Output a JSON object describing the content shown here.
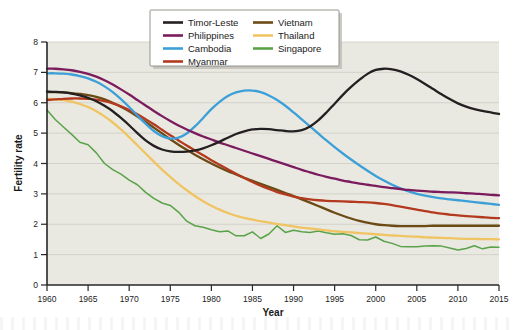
{
  "figure": {
    "caption_strip": "",
    "plot_background_color": "#e9e9e1",
    "page_background_color": "#ffffff"
  },
  "axes": {
    "x_label": "Year",
    "y_label": "Fertility rate",
    "x_ticks": [
      "1960",
      "1965",
      "1970",
      "1975",
      "1980",
      "1985",
      "1990",
      "1995",
      "2000",
      "2005",
      "2010",
      "2015"
    ],
    "y_ticks": [
      "0",
      "1",
      "2",
      "3",
      "4",
      "5",
      "6",
      "7",
      "8"
    ]
  },
  "legend": {
    "entries": [
      {
        "label": "Timor-Leste",
        "color": "#241f20"
      },
      {
        "label": "Vietnam",
        "color": "#6b4a16"
      },
      {
        "label": "Philippines",
        "color": "#7b1b5e"
      },
      {
        "label": "Thailand",
        "color": "#f0c462"
      },
      {
        "label": "Cambodia",
        "color": "#3d9fd8"
      },
      {
        "label": "Singapore",
        "color": "#5aa24a"
      },
      {
        "label": "Myanmar",
        "color": "#b33a1e"
      }
    ]
  },
  "chart_data": {
    "type": "line",
    "title": "",
    "subtitle": "",
    "xlabel": "Year",
    "ylabel": "Fertility rate",
    "xlim": [
      1960,
      2015
    ],
    "ylim": [
      0,
      8
    ],
    "grid": true,
    "legend_position": "top-center",
    "x": [
      1960,
      1961,
      1962,
      1963,
      1964,
      1965,
      1966,
      1967,
      1968,
      1969,
      1970,
      1971,
      1972,
      1973,
      1974,
      1975,
      1976,
      1977,
      1978,
      1979,
      1980,
      1981,
      1982,
      1983,
      1984,
      1985,
      1986,
      1987,
      1988,
      1989,
      1990,
      1991,
      1992,
      1993,
      1994,
      1995,
      1996,
      1997,
      1998,
      1999,
      2000,
      2001,
      2002,
      2003,
      2004,
      2005,
      2006,
      2007,
      2008,
      2009,
      2010,
      2011,
      2012,
      2013,
      2014,
      2015
    ],
    "series": [
      {
        "name": "Timor-Leste",
        "color": "#241f20",
        "values": [
          6.37,
          6.36,
          6.34,
          6.3,
          6.24,
          6.16,
          6.05,
          5.9,
          5.72,
          5.5,
          5.26,
          5.0,
          4.76,
          4.58,
          4.46,
          4.4,
          4.38,
          4.39,
          4.43,
          4.5,
          4.6,
          4.72,
          4.85,
          4.97,
          5.06,
          5.12,
          5.14,
          5.13,
          5.1,
          5.07,
          5.06,
          5.1,
          5.22,
          5.42,
          5.68,
          5.97,
          6.26,
          6.52,
          6.75,
          6.95,
          7.08,
          7.12,
          7.1,
          7.03,
          6.92,
          6.78,
          6.62,
          6.45,
          6.28,
          6.12,
          5.98,
          5.87,
          5.79,
          5.73,
          5.68,
          5.63
        ]
      },
      {
        "name": "Philippines",
        "color": "#7b1b5e",
        "values": [
          7.12,
          7.12,
          7.1,
          7.07,
          7.02,
          6.95,
          6.86,
          6.74,
          6.6,
          6.44,
          6.27,
          6.09,
          5.91,
          5.73,
          5.56,
          5.4,
          5.25,
          5.12,
          5.0,
          4.89,
          4.79,
          4.69,
          4.6,
          4.51,
          4.42,
          4.33,
          4.24,
          4.15,
          4.06,
          3.97,
          3.88,
          3.79,
          3.71,
          3.63,
          3.56,
          3.5,
          3.44,
          3.39,
          3.34,
          3.3,
          3.26,
          3.22,
          3.19,
          3.16,
          3.13,
          3.11,
          3.09,
          3.07,
          3.06,
          3.05,
          3.04,
          3.02,
          3.01,
          2.99,
          2.97,
          2.95
        ]
      },
      {
        "name": "Cambodia",
        "color": "#3d9fd8",
        "values": [
          6.97,
          6.97,
          6.96,
          6.93,
          6.88,
          6.8,
          6.69,
          6.54,
          6.35,
          6.12,
          5.86,
          5.58,
          5.31,
          5.07,
          4.9,
          4.82,
          4.85,
          4.99,
          5.22,
          5.5,
          5.79,
          6.03,
          6.22,
          6.34,
          6.4,
          6.4,
          6.35,
          6.24,
          6.09,
          5.9,
          5.68,
          5.45,
          5.22,
          4.99,
          4.76,
          4.54,
          4.33,
          4.13,
          3.94,
          3.76,
          3.59,
          3.44,
          3.3,
          3.18,
          3.08,
          3.0,
          2.94,
          2.89,
          2.85,
          2.82,
          2.79,
          2.76,
          2.73,
          2.7,
          2.67,
          2.64
        ]
      },
      {
        "name": "Myanmar",
        "color": "#b33a1e",
        "values": [
          6.09,
          6.11,
          6.13,
          6.14,
          6.14,
          6.13,
          6.1,
          6.05,
          5.98,
          5.88,
          5.76,
          5.62,
          5.46,
          5.29,
          5.11,
          4.93,
          4.76,
          4.59,
          4.43,
          4.27,
          4.11,
          3.96,
          3.81,
          3.66,
          3.52,
          3.39,
          3.27,
          3.16,
          3.06,
          2.98,
          2.91,
          2.86,
          2.82,
          2.79,
          2.77,
          2.76,
          2.75,
          2.74,
          2.73,
          2.72,
          2.7,
          2.67,
          2.63,
          2.58,
          2.53,
          2.48,
          2.43,
          2.39,
          2.35,
          2.32,
          2.29,
          2.27,
          2.25,
          2.23,
          2.21,
          2.2
        ]
      },
      {
        "name": "Vietnam",
        "color": "#6b4a16",
        "values": [
          6.35,
          6.35,
          6.34,
          6.32,
          6.29,
          6.25,
          6.19,
          6.11,
          6.0,
          5.87,
          5.72,
          5.55,
          5.37,
          5.18,
          4.99,
          4.8,
          4.62,
          4.45,
          4.29,
          4.14,
          4.0,
          3.87,
          3.75,
          3.64,
          3.53,
          3.43,
          3.33,
          3.23,
          3.13,
          3.03,
          2.93,
          2.82,
          2.71,
          2.6,
          2.49,
          2.38,
          2.28,
          2.19,
          2.11,
          2.05,
          2.0,
          1.97,
          1.95,
          1.94,
          1.94,
          1.94,
          1.94,
          1.95,
          1.95,
          1.95,
          1.95,
          1.95,
          1.95,
          1.95,
          1.95,
          1.95
        ]
      },
      {
        "name": "Thailand",
        "color": "#f0c462",
        "values": [
          6.13,
          6.12,
          6.09,
          6.04,
          5.96,
          5.86,
          5.72,
          5.55,
          5.35,
          5.12,
          4.87,
          4.6,
          4.33,
          4.06,
          3.8,
          3.56,
          3.33,
          3.12,
          2.93,
          2.76,
          2.61,
          2.48,
          2.37,
          2.28,
          2.21,
          2.15,
          2.1,
          2.05,
          2.01,
          1.97,
          1.93,
          1.89,
          1.86,
          1.83,
          1.8,
          1.77,
          1.75,
          1.73,
          1.71,
          1.69,
          1.67,
          1.65,
          1.63,
          1.62,
          1.6,
          1.59,
          1.57,
          1.56,
          1.55,
          1.54,
          1.53,
          1.52,
          1.52,
          1.51,
          1.51,
          1.5
        ]
      },
      {
        "name": "Singapore",
        "color": "#5aa24a",
        "values": [
          5.76,
          5.45,
          5.2,
          4.96,
          4.7,
          4.62,
          4.35,
          4.0,
          3.8,
          3.65,
          3.45,
          3.3,
          3.05,
          2.85,
          2.7,
          2.62,
          2.4,
          2.1,
          1.95,
          1.9,
          1.82,
          1.75,
          1.78,
          1.62,
          1.62,
          1.75,
          1.53,
          1.68,
          1.95,
          1.73,
          1.8,
          1.75,
          1.73,
          1.78,
          1.72,
          1.67,
          1.69,
          1.63,
          1.49,
          1.48,
          1.58,
          1.44,
          1.37,
          1.27,
          1.26,
          1.26,
          1.28,
          1.29,
          1.28,
          1.22,
          1.15,
          1.2,
          1.29,
          1.19,
          1.25,
          1.24
        ]
      }
    ]
  }
}
